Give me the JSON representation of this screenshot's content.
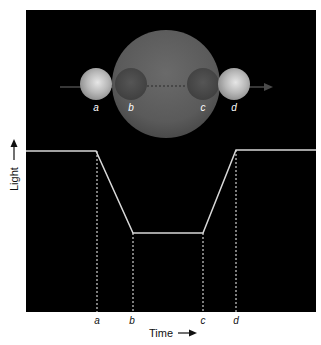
{
  "diagram": {
    "panel": {
      "background": "#000000",
      "x": 26,
      "y": 10,
      "width": 290,
      "height": 302
    },
    "star": {
      "label": "",
      "cx": 166,
      "cy": 84,
      "r": 54,
      "color": "#5e5e5e"
    },
    "planets": [
      {
        "id": "a",
        "label": "a",
        "cx": 96,
        "cy": 84,
        "r": 16,
        "state": "outside star (bright)"
      },
      {
        "id": "b",
        "label": "b",
        "cx": 131,
        "cy": 84,
        "r": 16,
        "state": "in front of star (dark)"
      },
      {
        "id": "c",
        "label": "c",
        "cx": 203,
        "cy": 84,
        "r": 16,
        "state": "in front of star (dark)"
      },
      {
        "id": "d",
        "label": "d",
        "cx": 234,
        "cy": 84,
        "r": 16,
        "state": "outside star (bright)"
      }
    ],
    "motion_arrow": {
      "direction": "right",
      "x1": 60,
      "x2": 272,
      "y": 87
    },
    "light_curve": {
      "points": [
        [
          26,
          151
        ],
        [
          96,
          151
        ],
        [
          133,
          233
        ],
        [
          203,
          233
        ],
        [
          236,
          150
        ],
        [
          316,
          150
        ]
      ],
      "color": "#d8d8d8"
    },
    "markers": [
      {
        "label": "a",
        "x": 97
      },
      {
        "label": "b",
        "x": 133
      },
      {
        "label": "c",
        "x": 203
      },
      {
        "label": "d",
        "x": 236
      }
    ],
    "axes": {
      "x_label": "Time",
      "y_label": "Light"
    }
  }
}
